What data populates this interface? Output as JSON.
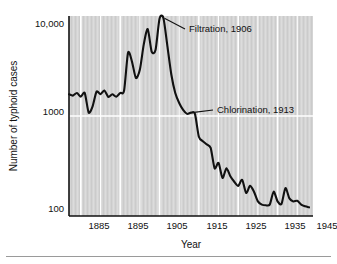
{
  "figure": {
    "background_color": "#ffffff",
    "plot_background_color": "#d4d4d4",
    "gridline_color": "#ffffff",
    "line_color": "#111111",
    "axis_color": "#111111"
  },
  "axes": {
    "y_title": "Number of typhoid cases",
    "x_title": "Year",
    "y_ticks": [
      "10,000",
      "1000",
      "100"
    ],
    "x_ticks": [
      "1885",
      "1895",
      "1905",
      "1915",
      "1925",
      "1935",
      "1945"
    ]
  },
  "annotations": [
    {
      "name": "filtration",
      "label": "Filtration, 1906",
      "year": 1906,
      "value": 9500
    },
    {
      "name": "chlorination",
      "label": "Chlorination, 1913",
      "year": 1913,
      "value": 1080
    }
  ],
  "chart_data": {
    "type": "line",
    "title": "",
    "subtitle": "",
    "xlabel": "Year",
    "ylabel": "Number of typhoid cases",
    "yscale": "log",
    "xlim": [
      1882,
      1944
    ],
    "ylim": [
      100,
      10000
    ],
    "grid": true,
    "legend": "none",
    "y_tick_values": [
      100,
      1000,
      10000
    ],
    "y_tick_labels": [
      "100",
      "1000",
      "10,000"
    ],
    "x_tick_values": [
      1885,
      1895,
      1905,
      1915,
      1925,
      1935,
      1945
    ],
    "x_tick_labels": [
      "1885",
      "1895",
      "1905",
      "1915",
      "1925",
      "1935",
      "1945"
    ],
    "series": [
      {
        "name": "Typhoid cases",
        "x": [
          1882,
          1883,
          1884,
          1885,
          1886,
          1887,
          1888,
          1889,
          1890,
          1891,
          1892,
          1893,
          1894,
          1895,
          1896,
          1897,
          1898,
          1899,
          1900,
          1901,
          1902,
          1903,
          1904,
          1905,
          1906,
          1907,
          1908,
          1909,
          1910,
          1911,
          1912,
          1913,
          1914,
          1915,
          1916,
          1917,
          1918,
          1919,
          1920,
          1921,
          1922,
          1923,
          1924,
          1925,
          1926,
          1927,
          1928,
          1929,
          1930,
          1931,
          1932,
          1933,
          1934,
          1935,
          1936,
          1937,
          1938,
          1939,
          1940,
          1941,
          1942,
          1943
        ],
        "values": [
          1650,
          1600,
          1700,
          1560,
          1700,
          1080,
          1250,
          1750,
          1650,
          1800,
          1550,
          1650,
          1560,
          1700,
          1800,
          4300,
          3500,
          2400,
          2900,
          5200,
          7400,
          4400,
          4600,
          9400,
          9500,
          5000,
          2600,
          1700,
          1350,
          1150,
          1050,
          1080,
          1050,
          620,
          560,
          520,
          480,
          300,
          340,
          240,
          300,
          250,
          220,
          200,
          230,
          170,
          200,
          175,
          140,
          130,
          128,
          130,
          175,
          140,
          132,
          190,
          150,
          140,
          142,
          130,
          125,
          122
        ]
      }
    ],
    "annotations": [
      {
        "label": "Filtration, 1906",
        "x": 1906,
        "y": 9500
      },
      {
        "label": "Chlorination, 1913",
        "x": 1913,
        "y": 1080
      }
    ]
  }
}
